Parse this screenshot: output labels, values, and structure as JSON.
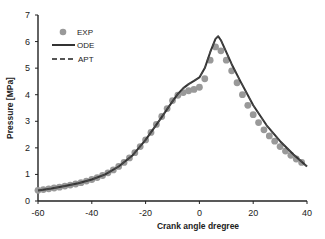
{
  "chart_data": {
    "type": "line",
    "title": "",
    "xlabel": "Crank angle dregree",
    "ylabel": "Pressure [MPa]",
    "xlim": [
      -60,
      40
    ],
    "ylim": [
      0,
      7
    ],
    "xticks": [
      -60,
      -40,
      -20,
      0,
      20,
      40
    ],
    "yticks": [
      0,
      1,
      2,
      3,
      4,
      5,
      6,
      7
    ],
    "grid": false,
    "legend_position": "upper-left",
    "series": [
      {
        "name": "EXP",
        "style": "markers",
        "color": "#999999",
        "x": [
          -60,
          -58,
          -56,
          -54,
          -52,
          -50,
          -48,
          -46,
          -44,
          -42,
          -40,
          -38,
          -36,
          -34,
          -32,
          -30,
          -28,
          -26,
          -24,
          -22,
          -20,
          -18,
          -16,
          -14,
          -12,
          -10,
          -8,
          -6,
          -4,
          -2,
          0,
          2,
          4,
          6,
          8,
          10,
          12,
          14,
          16,
          18,
          20,
          22,
          24,
          26,
          28,
          30,
          32,
          34,
          36,
          38
        ],
        "y": [
          0.4,
          0.43,
          0.46,
          0.49,
          0.52,
          0.56,
          0.6,
          0.64,
          0.69,
          0.75,
          0.81,
          0.88,
          0.96,
          1.06,
          1.17,
          1.3,
          1.45,
          1.62,
          1.82,
          2.05,
          2.3,
          2.58,
          2.88,
          3.18,
          3.48,
          3.78,
          3.98,
          4.08,
          4.15,
          4.2,
          4.28,
          4.6,
          5.3,
          5.8,
          5.65,
          5.3,
          4.9,
          4.45,
          4.0,
          3.6,
          3.25,
          2.95,
          2.68,
          2.45,
          2.25,
          2.05,
          1.88,
          1.72,
          1.58,
          1.45
        ]
      },
      {
        "name": "ODE",
        "style": "solid",
        "color": "#333333",
        "x": [
          -60,
          -55,
          -50,
          -45,
          -40,
          -35,
          -30,
          -25,
          -20,
          -15,
          -10,
          -8,
          -6,
          -4,
          -2,
          0,
          2,
          4,
          6,
          7,
          8,
          10,
          12,
          15,
          20,
          25,
          30,
          35,
          40
        ],
        "y": [
          0.4,
          0.47,
          0.56,
          0.67,
          0.81,
          1.0,
          1.3,
          1.7,
          2.3,
          3.02,
          3.75,
          4.03,
          4.25,
          4.4,
          4.52,
          4.65,
          5.0,
          5.6,
          6.1,
          6.2,
          6.05,
          5.6,
          5.15,
          4.55,
          3.6,
          2.85,
          2.25,
          1.75,
          1.3
        ]
      },
      {
        "name": "APT",
        "style": "dashed",
        "color": "#555555",
        "x": [
          -60,
          -55,
          -50,
          -45,
          -40,
          -35,
          -30,
          -25,
          -20,
          -15,
          -10,
          -8,
          -6,
          -4,
          -2,
          0,
          2,
          4,
          6,
          7,
          8,
          10,
          12,
          15,
          20,
          25,
          30,
          35,
          40
        ],
        "y": [
          0.4,
          0.47,
          0.56,
          0.67,
          0.81,
          1.0,
          1.3,
          1.7,
          2.3,
          3.02,
          3.75,
          4.03,
          4.25,
          4.4,
          4.52,
          4.65,
          5.0,
          5.6,
          6.1,
          6.2,
          6.05,
          5.6,
          5.15,
          4.55,
          3.6,
          2.85,
          2.25,
          1.75,
          1.3
        ]
      }
    ]
  },
  "legend": {
    "items": [
      {
        "label": "EXP"
      },
      {
        "label": "ODE"
      },
      {
        "label": "APT"
      }
    ]
  },
  "axes": {
    "xlabel": "Crank angle dregree",
    "ylabel": "Pressure [MPa]"
  }
}
